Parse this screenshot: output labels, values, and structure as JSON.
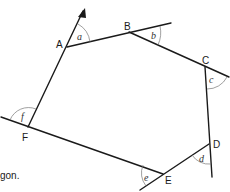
{
  "diagram": {
    "vertices": [
      {
        "id": "A",
        "label": "A"
      },
      {
        "id": "B",
        "label": "B"
      },
      {
        "id": "C",
        "label": "C"
      },
      {
        "id": "D",
        "label": "D"
      },
      {
        "id": "E",
        "label": "E"
      },
      {
        "id": "F",
        "label": "F"
      }
    ],
    "angles": [
      {
        "at": "A",
        "label": "a"
      },
      {
        "at": "B",
        "label": "b"
      },
      {
        "at": "C",
        "label": "c"
      },
      {
        "at": "D",
        "label": "d"
      },
      {
        "at": "E",
        "label": "e"
      },
      {
        "at": "F",
        "label": "f"
      }
    ],
    "arrow": {
      "from": "F",
      "through": "A",
      "icon": "arrowhead"
    }
  },
  "caption": "gon."
}
